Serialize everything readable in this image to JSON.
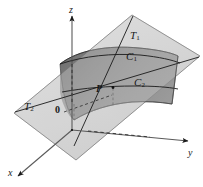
{
  "figure": {
    "background_color": "#ffffff",
    "line_color": "#1a1a1a",
    "surface_color": "#8a8a8a",
    "surface_shadow_color": "#6f6f6f",
    "plane_color": "#d9d9d9",
    "plane_color_dark": "#c2c2c2"
  },
  "axes": {
    "z_label": "z",
    "y_label": "y",
    "x_label": "x"
  },
  "points": {
    "origin_label": "0",
    "tangency_label": "P"
  },
  "labels": {
    "tangent_line_1": "T",
    "tangent_line_1_sub": "1",
    "tangent_line_2": "T",
    "tangent_line_2_sub": "2",
    "curve_1": "C",
    "curve_1_sub": "1",
    "curve_2": "C",
    "curve_2_sub": "2"
  }
}
